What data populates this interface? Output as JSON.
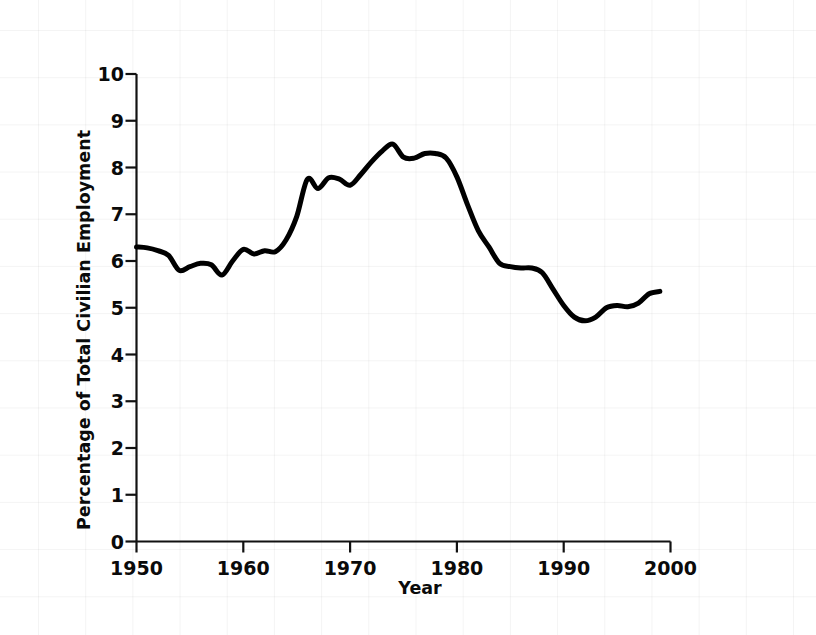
{
  "chart_data": {
    "type": "line",
    "title": "",
    "subtitle": "",
    "xlabel": "Year",
    "ylabel": "Percentage of Total Civilian Employment",
    "xlim": [
      1950,
      2000
    ],
    "ylim": [
      0,
      10
    ],
    "xticks": [
      1950,
      1960,
      1970,
      1980,
      1990,
      2000
    ],
    "xtick_labels": [
      "1950",
      "1960",
      "1970",
      "1980",
      "1990",
      "2000"
    ],
    "yticks": [
      0,
      1,
      2,
      3,
      4,
      5,
      6,
      7,
      8,
      9,
      10
    ],
    "ytick_labels": [
      "0",
      "1",
      "2",
      "3",
      "4",
      "5",
      "6",
      "7",
      "8",
      "9",
      "10"
    ],
    "grid": "faint background grid only",
    "legend": null,
    "annotations": [],
    "series": [
      {
        "name": "Percentage of Total Civilian Employment",
        "color": "#000000",
        "line_width": 5,
        "x": [
          1950,
          1951,
          1952,
          1953,
          1954,
          1955,
          1956,
          1957,
          1958,
          1959,
          1960,
          1961,
          1962,
          1963,
          1964,
          1965,
          1966,
          1967,
          1968,
          1969,
          1970,
          1971,
          1972,
          1973,
          1974,
          1975,
          1976,
          1977,
          1978,
          1979,
          1980,
          1981,
          1982,
          1983,
          1984,
          1985,
          1986,
          1987,
          1988,
          1989,
          1990,
          1991,
          1992,
          1993,
          1994,
          1995,
          1996,
          1997,
          1998,
          1999
        ],
        "y": [
          6.3,
          6.28,
          6.22,
          6.12,
          5.8,
          5.88,
          5.95,
          5.92,
          5.7,
          6.0,
          6.25,
          6.15,
          6.22,
          6.2,
          6.45,
          6.95,
          7.75,
          7.55,
          7.78,
          7.75,
          7.62,
          7.85,
          8.12,
          8.35,
          8.5,
          8.22,
          8.2,
          8.3,
          8.3,
          8.2,
          7.8,
          7.2,
          6.65,
          6.3,
          5.95,
          5.88,
          5.85,
          5.85,
          5.75,
          5.4,
          5.05,
          4.8,
          4.72,
          4.8,
          5.0,
          5.05,
          5.02,
          5.1,
          5.3,
          5.35
        ]
      }
    ]
  },
  "axes": {
    "y_axis_name": "percentage-axis",
    "x_axis_name": "year-axis"
  }
}
